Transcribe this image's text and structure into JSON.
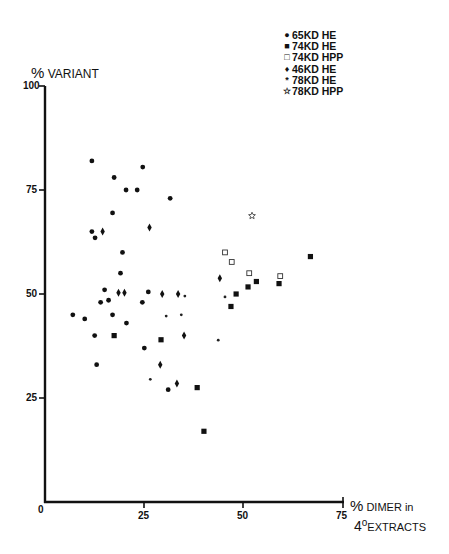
{
  "chart_data": {
    "type": "scatter",
    "title": "",
    "xlabel": "% DIMER in 4° EXTRACTS",
    "ylabel": "% VARIANT",
    "xlim": [
      0,
      75
    ],
    "ylim": [
      0,
      100
    ],
    "x_ticks": [
      "0",
      "25",
      "50",
      "75"
    ],
    "y_ticks": [
      "25",
      "50",
      "75",
      "100"
    ],
    "grid": false,
    "legend_position": "top-right",
    "legend": [
      "65KD HE",
      "74KD HE",
      "74KD HPP",
      "46KD HE",
      "78KD HE",
      "78KD HPP"
    ],
    "series": [
      {
        "name": "65KD HE",
        "marker": "filled-circle",
        "points": [
          [
            7,
            45
          ],
          [
            10,
            44
          ],
          [
            12.5,
            40
          ],
          [
            13,
            33
          ],
          [
            14,
            48
          ],
          [
            15,
            51
          ],
          [
            16,
            48.5
          ],
          [
            17,
            45
          ],
          [
            19,
            55
          ],
          [
            19.5,
            60
          ],
          [
            20.5,
            43
          ],
          [
            24.5,
            48
          ],
          [
            25,
            37
          ],
          [
            26,
            50.5
          ],
          [
            31,
            27
          ],
          [
            11.8,
            82
          ],
          [
            17.4,
            78
          ],
          [
            24.6,
            80.5
          ],
          [
            23.2,
            75
          ],
          [
            20.4,
            75
          ],
          [
            31.5,
            73
          ],
          [
            17,
            69.5
          ],
          [
            11.8,
            65
          ],
          [
            12.6,
            63.5
          ]
        ]
      },
      {
        "name": "74KD HE",
        "marker": "filled-square",
        "points": [
          [
            17.4,
            40
          ],
          [
            29.2,
            39
          ],
          [
            38.3,
            27.5
          ],
          [
            40,
            17
          ],
          [
            46.8,
            47
          ],
          [
            48.1,
            50
          ],
          [
            51.1,
            51.7
          ],
          [
            53.2,
            53
          ],
          [
            58.9,
            52.5
          ],
          [
            66.8,
            59
          ]
        ]
      },
      {
        "name": "74KD HPP",
        "marker": "open-square",
        "points": [
          [
            45.3,
            60
          ],
          [
            47,
            57.7
          ],
          [
            51.4,
            55
          ],
          [
            59.2,
            54.3
          ]
        ]
      },
      {
        "name": "46KD HE",
        "marker": "filled-diamond",
        "points": [
          [
            14.5,
            65
          ],
          [
            18.5,
            50.3
          ],
          [
            20,
            50.3
          ],
          [
            26.3,
            66
          ],
          [
            29.5,
            50
          ],
          [
            33.5,
            50
          ],
          [
            35,
            40
          ],
          [
            29,
            33
          ],
          [
            33.2,
            28.5
          ],
          [
            44,
            53.8
          ]
        ]
      },
      {
        "name": "78KD HE",
        "marker": "asterisk",
        "points": [
          [
            35.2,
            49.5
          ],
          [
            30.5,
            44.7
          ],
          [
            34.3,
            45
          ],
          [
            26.5,
            29.5
          ],
          [
            43.6,
            38.9
          ],
          [
            45.3,
            49.3
          ]
        ]
      },
      {
        "name": "78KD HPP",
        "marker": "open-star",
        "points": [
          [
            52.1,
            68.8
          ]
        ]
      }
    ]
  },
  "axes": {
    "ylabel_pct": "%",
    "ylabel_text": "VARIANT",
    "xlabel_pct": "%",
    "xlabel_line1": "DIMER in",
    "xlabel_line2_prefix": "4",
    "xlabel_line2_sup": "o",
    "xlabel_line2_text": "EXTRACTS",
    "ticks": {
      "y100": "100",
      "y75": "75",
      "y50": "50",
      "y25": "25",
      "x0": "0",
      "x25": "25",
      "x50": "50",
      "x75": "75"
    }
  },
  "legend": {
    "items": [
      {
        "symbol": "●",
        "label": "65KD HE"
      },
      {
        "symbol": "■",
        "label": "74KD HE"
      },
      {
        "symbol": "□",
        "label": "74KD HPP"
      },
      {
        "symbol": "♦",
        "label": "46KD HE"
      },
      {
        "symbol": "*",
        "label": "78KD HE"
      },
      {
        "symbol": "☆",
        "label": "78KD HPP"
      }
    ]
  }
}
